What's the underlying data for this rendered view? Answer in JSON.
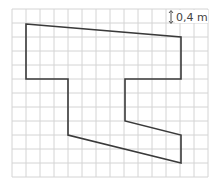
{
  "diagram": {
    "type": "grid-shape",
    "scale_label": "0,4 m",
    "grid": {
      "x0": 12,
      "y0": 9,
      "cell": 14,
      "cols": 14,
      "rows": 12,
      "color": "#d4d4d4"
    },
    "shape": {
      "stroke": "#3a3a3a",
      "points": [
        [
          26,
          24
        ],
        [
          181,
          37
        ],
        [
          181,
          79
        ],
        [
          125,
          79
        ],
        [
          125,
          121
        ],
        [
          181,
          135
        ],
        [
          181,
          163
        ],
        [
          68,
          135
        ],
        [
          68,
          79
        ],
        [
          26,
          79
        ]
      ]
    }
  }
}
